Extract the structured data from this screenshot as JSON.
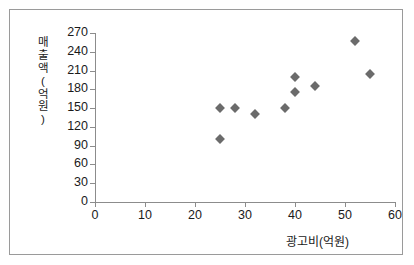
{
  "chart_data": {
    "type": "scatter",
    "title": "",
    "xlabel": "광고비(억원)",
    "ylabel": "매출액(억원)",
    "xlim": [
      0,
      60
    ],
    "ylim": [
      0,
      270
    ],
    "xticks": [
      0,
      10,
      20,
      30,
      40,
      50,
      60
    ],
    "yticks": [
      0,
      30,
      60,
      90,
      120,
      150,
      180,
      210,
      240,
      270
    ],
    "grid": false,
    "legend": false,
    "marker_shape": "diamond",
    "marker_color": "#6b6b6b",
    "series": [
      {
        "name": "",
        "points": [
          {
            "x": 25,
            "y": 100
          },
          {
            "x": 25,
            "y": 150
          },
          {
            "x": 28,
            "y": 150
          },
          {
            "x": 32,
            "y": 140
          },
          {
            "x": 38,
            "y": 150
          },
          {
            "x": 40,
            "y": 175
          },
          {
            "x": 40,
            "y": 200
          },
          {
            "x": 44,
            "y": 185
          },
          {
            "x": 52,
            "y": 258
          },
          {
            "x": 55,
            "y": 205
          }
        ]
      }
    ]
  },
  "axis_title_y_chars": [
    "매",
    "출",
    "액",
    "(",
    "억",
    "원",
    ")"
  ]
}
